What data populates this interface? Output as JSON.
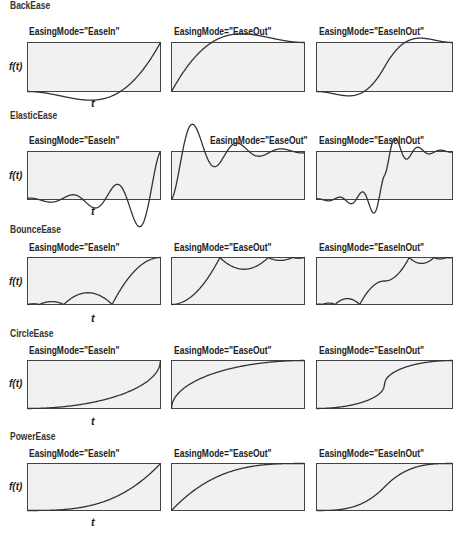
{
  "axis": {
    "y_label": "f(t)",
    "x_label": "t"
  },
  "columns": [
    {
      "mode_label": "EasingMode=\"EaseIn\""
    },
    {
      "mode_label": "EasingMode=\"EaseOut\""
    },
    {
      "mode_label": "EasingMode=\"EaseInOut\""
    }
  ],
  "colors": {
    "box_fill": "#f1f1f1",
    "box_stroke": "#444444",
    "curve": "#333333"
  },
  "sections": [
    {
      "title": "BackEase",
      "type": "back"
    },
    {
      "title": "ElasticEase",
      "type": "elastic"
    },
    {
      "title": "BounceEase",
      "type": "bounce"
    },
    {
      "title": "CircleEase",
      "type": "circle"
    },
    {
      "title": "PowerEase",
      "type": "power"
    }
  ]
}
